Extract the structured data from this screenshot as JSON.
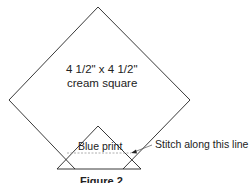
{
  "diagram": {
    "square_label_line1": "4 1/2\" x 4 1/2\"",
    "square_label_line2": "cream square",
    "triangle_label": "Blue print",
    "callout_label": "Stitch along this line",
    "caption": "Figure 2"
  },
  "colors": {
    "line": "#222222",
    "dashed": "#9a9a9a",
    "background": "#ffffff"
  }
}
